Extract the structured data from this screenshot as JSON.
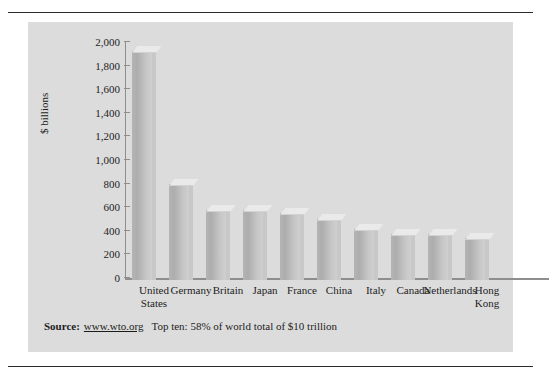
{
  "figure": {
    "panel_color": "#dcdcdc",
    "rule_color": "#2b2b2b",
    "bar_color": "#b9b9b9"
  },
  "source_note": {
    "label": "Source:",
    "url": "www.wto.org",
    "note": "Top ten: 58% of world total of $10 trillion"
  },
  "chart_data": {
    "type": "bar",
    "title": "",
    "xlabel": "",
    "ylabel": "$ billions",
    "ylim": [
      0,
      2000
    ],
    "ytick_values": [
      0,
      200,
      400,
      600,
      800,
      1000,
      1200,
      1400,
      1600,
      1800,
      2000
    ],
    "ytick_labels": [
      "0",
      "200",
      "400",
      "600",
      "800",
      "1,000",
      "1,200",
      "1,400",
      "1,600",
      "1,800",
      "2,000"
    ],
    "grid": false,
    "legend": "none",
    "categories": [
      "United States",
      "Germany",
      "Britain",
      "Japan",
      "France",
      "China",
      "Italy",
      "Canada",
      "Netherlands",
      "Hong Kong"
    ],
    "category_lines": [
      [
        "United",
        "States"
      ],
      [
        "Germany"
      ],
      [
        "Britain"
      ],
      [
        "Japan"
      ],
      [
        "France"
      ],
      [
        "China"
      ],
      [
        "Italy"
      ],
      [
        "Canada"
      ],
      [
        "Netherlands"
      ],
      [
        "Hong",
        "Kong"
      ]
    ],
    "values": [
      1940,
      815,
      590,
      590,
      570,
      515,
      430,
      390,
      390,
      355
    ]
  }
}
